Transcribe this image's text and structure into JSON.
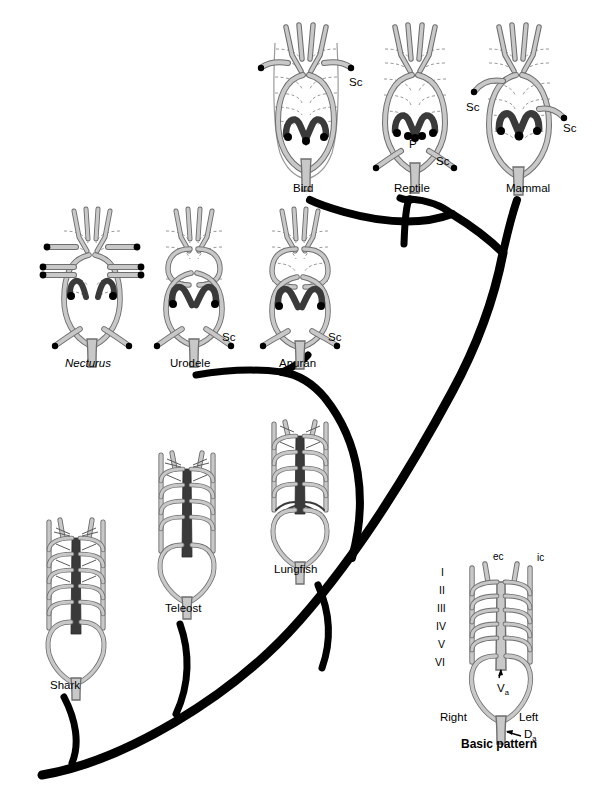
{
  "figure": {
    "background_color": "#ffffff",
    "branch_color": "#000000",
    "vessel_fill": "#c8c8c8",
    "vessel_stroke": "#6e6e6e",
    "dark_vessel_fill": "#3a3a3a",
    "mid_vessel_fill": "#555555",
    "dashed_stroke": "#9a9a9a"
  },
  "taxa": [
    {
      "id": "bird",
      "label": "Bird",
      "label_x": 293,
      "label_y": 192,
      "cx": 306,
      "cy": 105,
      "annotations": [
        {
          "text": "Sc",
          "x": 349,
          "y": 86
        }
      ]
    },
    {
      "id": "reptile",
      "label": "Reptile",
      "label_x": 394,
      "label_y": 192,
      "cx": 415,
      "cy": 105,
      "annotations": [
        {
          "text": "P",
          "x": 409,
          "y": 148
        },
        {
          "text": "Sc",
          "x": 436,
          "y": 165
        }
      ]
    },
    {
      "id": "mammal",
      "label": "Mammal",
      "label_x": 506,
      "label_y": 192,
      "cx": 519,
      "cy": 105,
      "annotations": [
        {
          "text": "Sc",
          "x": 466,
          "y": 111
        },
        {
          "text": "Sc",
          "x": 563,
          "y": 132
        }
      ]
    },
    {
      "id": "necturus",
      "label": "Necturus",
      "italic": true,
      "label_x": 78,
      "label_y": 367,
      "cx": 92,
      "cy": 283,
      "annotations": []
    },
    {
      "id": "urodele",
      "label": "Urodele",
      "label_x": 170,
      "label_y": 367,
      "cx": 194,
      "cy": 283,
      "annotations": [
        {
          "text": "Sc",
          "x": 224,
          "y": 337
        }
      ]
    },
    {
      "id": "anuran",
      "label": "Anuran",
      "label_x": 279,
      "label_y": 367,
      "cx": 300,
      "cy": 283,
      "annotations": [
        {
          "text": "Sc",
          "x": 329,
          "y": 337
        }
      ]
    },
    {
      "id": "shark",
      "label": "Shark",
      "label_x": 50,
      "label_y": 689,
      "cx": 76,
      "cy": 600,
      "annotations": []
    },
    {
      "id": "teleost",
      "label": "Teleost",
      "label_x": 165,
      "label_y": 612,
      "cx": 187,
      "cy": 525,
      "annotations": []
    },
    {
      "id": "lungfish",
      "label": "Lungfish",
      "label_x": 274,
      "label_y": 573,
      "cx": 300,
      "cy": 488,
      "annotations": []
    }
  ],
  "key_diagram": {
    "label": "Basic pattern",
    "label_x": 461,
    "label_y": 745,
    "cx": 501,
    "cy": 640,
    "arch_numerals": [
      "I",
      "II",
      "III",
      "IV",
      "V",
      "VI"
    ],
    "numeral_x": 441,
    "numeral_start_y": 572,
    "numeral_step": 18,
    "annotations": [
      {
        "text": "ec",
        "x": 496,
        "y": 560
      },
      {
        "text": "ic",
        "x": 537,
        "y": 561
      },
      {
        "text": "V",
        "x": 498,
        "y": 689,
        "sub": "a"
      },
      {
        "text": "Right",
        "x": 440,
        "y": 719
      },
      {
        "text": "Left",
        "x": 519,
        "y": 719
      },
      {
        "text": "D",
        "x": 530,
        "y": 734,
        "sub": "a"
      }
    ]
  },
  "tree": {
    "description": "Phylogenetic tree connecting taxa",
    "branches": [
      {
        "name": "trunk-base-to-crown",
        "from": "shark-base",
        "to": "amniote-node"
      },
      {
        "name": "shark-tip",
        "to": "shark"
      },
      {
        "name": "teleost-tip",
        "to": "teleost"
      },
      {
        "name": "lungfish-tip",
        "to": "lungfish"
      },
      {
        "name": "amphibian-node-to-urodele",
        "to": "urodele"
      },
      {
        "name": "amphibian-node-to-anuran",
        "to": "anuran"
      },
      {
        "name": "amniote-node-to-bird",
        "to": "bird"
      },
      {
        "name": "amniote-node-to-reptile",
        "to": "reptile"
      },
      {
        "name": "amniote-node-to-mammal",
        "to": "mammal"
      }
    ]
  }
}
